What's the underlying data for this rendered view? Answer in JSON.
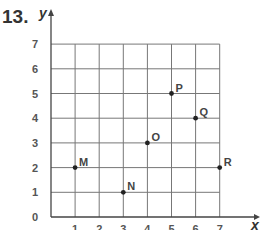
{
  "question_number": "13.",
  "chart_data": {
    "type": "scatter",
    "title": "",
    "xlabel": "x",
    "ylabel": "y",
    "xlim": [
      0,
      7
    ],
    "ylim": [
      0,
      7
    ],
    "grid": true,
    "x_ticks": [
      "1",
      "2",
      "3",
      "4",
      "5",
      "6",
      "7"
    ],
    "y_ticks": [
      "0",
      "1",
      "2",
      "3",
      "4",
      "5",
      "6",
      "7"
    ],
    "points": [
      {
        "label": "M",
        "x": 1,
        "y": 2
      },
      {
        "label": "N",
        "x": 3,
        "y": 1
      },
      {
        "label": "O",
        "x": 4,
        "y": 3
      },
      {
        "label": "P",
        "x": 5,
        "y": 5
      },
      {
        "label": "Q",
        "x": 6,
        "y": 4
      },
      {
        "label": "R",
        "x": 7,
        "y": 2
      }
    ]
  }
}
